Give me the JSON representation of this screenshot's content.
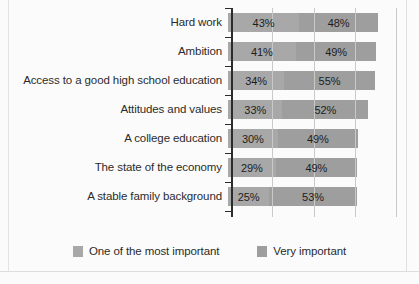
{
  "chart_data": {
    "type": "bar",
    "subtype": "stacked-horizontal",
    "title": "",
    "xlabel": "",
    "ylabel": "",
    "xlim": [
      0,
      100
    ],
    "grid": true,
    "gridline_values": [
      25,
      50,
      75,
      100
    ],
    "legend_position": "bottom",
    "categories": [
      "Hard work",
      "Ambition",
      "Access to a good high school education",
      "Attitudes and values",
      "A college education",
      "The state of the economy",
      "A stable family background"
    ],
    "series": [
      {
        "name": "One of the most important",
        "color": "#a8a8a8",
        "values": [
          43,
          41,
          34,
          33,
          30,
          29,
          25
        ],
        "labels": [
          "43%",
          "41%",
          "34%",
          "33%",
          "30%",
          "29%",
          "25%"
        ]
      },
      {
        "name": "Very important",
        "color": "#9e9e9e",
        "values": [
          48,
          49,
          55,
          52,
          49,
          49,
          53
        ],
        "labels": [
          "48%",
          "49%",
          "55%",
          "52%",
          "49%",
          "49%",
          "53%"
        ]
      }
    ]
  },
  "legend": {
    "items": [
      {
        "label": "One of the most important",
        "swatch": "legend-swatch-most-important"
      },
      {
        "label": "Very important",
        "swatch": "legend-swatch-very-important"
      }
    ]
  }
}
